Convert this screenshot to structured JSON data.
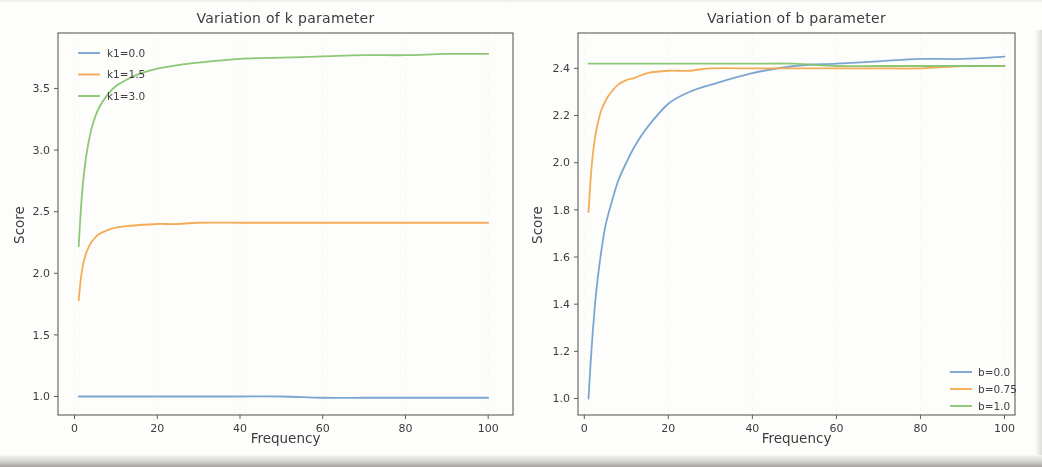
{
  "figure": {
    "background": "#fdfdfb",
    "text_color": "#3c3c3c",
    "axis_color": "#5d5d5d",
    "grid_color": "rgba(100,100,100,0.07)"
  },
  "chart_data": [
    {
      "type": "line",
      "title": "Variation of k parameter",
      "xlabel": "Frequency",
      "ylabel": "Score",
      "xlim": [
        -4,
        106
      ],
      "ylim": [
        0.85,
        3.95
      ],
      "xticks": [
        "0",
        "20",
        "40",
        "60",
        "80",
        "100"
      ],
      "yticks": [
        "1.0",
        "1.5",
        "2.0",
        "2.5",
        "3.0",
        "3.5"
      ],
      "grid": "faint-vertical",
      "legend_position": "upper left",
      "x": [
        1,
        1.5,
        2,
        2.5,
        3,
        4,
        5,
        6,
        8,
        10,
        12,
        15,
        20,
        25,
        30,
        40,
        50,
        60,
        70,
        80,
        90,
        100
      ],
      "series": [
        {
          "name": "k1=0.0",
          "color": "#74a1d0",
          "values": [
            1.0,
            1.0,
            1.0,
            1.0,
            1.0,
            1.0,
            1.0,
            1.0,
            1.0,
            1.0,
            1.0,
            1.0,
            1.0,
            1.0,
            1.0,
            1.0,
            1.0,
            0.99,
            0.99,
            0.99,
            0.99,
            0.99
          ]
        },
        {
          "name": "k1=1.5",
          "color": "#f4a84f",
          "values": [
            1.78,
            1.95,
            2.06,
            2.13,
            2.18,
            2.25,
            2.29,
            2.32,
            2.35,
            2.37,
            2.38,
            2.39,
            2.4,
            2.4,
            2.41,
            2.41,
            2.41,
            2.41,
            2.41,
            2.41,
            2.41,
            2.41
          ]
        },
        {
          "name": "k1=3.0",
          "color": "#86c56e",
          "values": [
            2.22,
            2.5,
            2.72,
            2.87,
            2.99,
            3.16,
            3.27,
            3.35,
            3.45,
            3.52,
            3.56,
            3.61,
            3.66,
            3.69,
            3.71,
            3.74,
            3.75,
            3.76,
            3.77,
            3.77,
            3.78,
            3.78
          ]
        }
      ]
    },
    {
      "type": "line",
      "title": "Variation of b parameter",
      "xlabel": "Frequency",
      "ylabel": "Score",
      "xlim": [
        -1.5,
        102.5
      ],
      "ylim": [
        0.93,
        2.55
      ],
      "xticks": [
        "0",
        "20",
        "40",
        "60",
        "80",
        "100"
      ],
      "yticks": [
        "1.0",
        "1.2",
        "1.4",
        "1.6",
        "1.8",
        "2.0",
        "2.2",
        "2.4"
      ],
      "grid": "faint-vertical",
      "legend_position": "lower right",
      "x": [
        1,
        1.5,
        2,
        2.5,
        3,
        4,
        5,
        6,
        8,
        10,
        12,
        15,
        20,
        25,
        30,
        40,
        50,
        60,
        70,
        80,
        90,
        100
      ],
      "series": [
        {
          "name": "b=0.0",
          "color": "#74a1d0",
          "values": [
            1.0,
            1.15,
            1.28,
            1.39,
            1.48,
            1.62,
            1.73,
            1.8,
            1.92,
            2.0,
            2.07,
            2.15,
            2.25,
            2.3,
            2.33,
            2.38,
            2.41,
            2.42,
            2.43,
            2.44,
            2.44,
            2.45
          ]
        },
        {
          "name": "b=0.75",
          "color": "#f4a84f",
          "values": [
            1.79,
            1.93,
            2.03,
            2.1,
            2.15,
            2.22,
            2.26,
            2.29,
            2.33,
            2.35,
            2.36,
            2.38,
            2.39,
            2.39,
            2.4,
            2.4,
            2.4,
            2.4,
            2.4,
            2.4,
            2.41,
            2.41
          ]
        },
        {
          "name": "b=1.0",
          "color": "#86c56e",
          "values": [
            2.42,
            2.42,
            2.42,
            2.42,
            2.42,
            2.42,
            2.42,
            2.42,
            2.42,
            2.42,
            2.42,
            2.42,
            2.42,
            2.42,
            2.42,
            2.42,
            2.42,
            2.41,
            2.41,
            2.41,
            2.41,
            2.41
          ]
        }
      ]
    }
  ]
}
